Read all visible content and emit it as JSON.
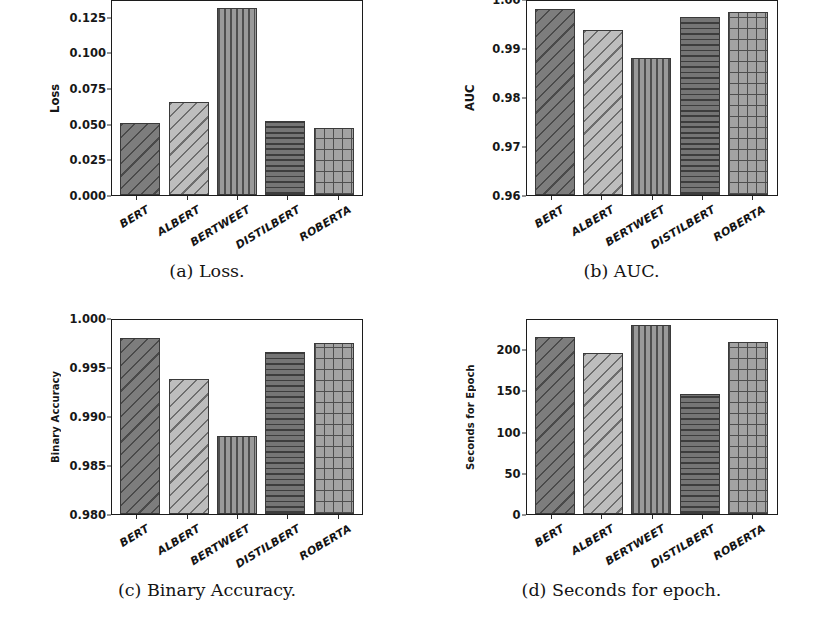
{
  "figure": {
    "models": [
      "BERT",
      "ALBERT",
      "BERTWEET",
      "DISTILBERT",
      "ROBERTA"
    ],
    "hatch_styles": [
      "hatch-diag-dark",
      "hatch-diag-light",
      "hatch-vert",
      "hatch-horiz",
      "hatch-grid"
    ],
    "subfigures": [
      {
        "caption": "(a) Loss."
      },
      {
        "caption": "(b) AUC."
      },
      {
        "caption": "(c) Binary Accuracy."
      },
      {
        "caption": "(d) Seconds for epoch."
      }
    ]
  },
  "chart_data": [
    {
      "type": "bar",
      "id": "loss",
      "title": "(a) Loss.",
      "xlabel": "",
      "ylabel": "Loss",
      "categories": [
        "BERT",
        "ALBERT",
        "BERTWEET",
        "DISTILBERT",
        "ROBERTA"
      ],
      "values": [
        0.0505,
        0.0655,
        0.1315,
        0.052,
        0.0468
      ],
      "ylim": [
        0.0,
        0.1375
      ],
      "yticks": [
        0.0,
        0.025,
        0.05,
        0.075,
        0.1,
        0.125
      ],
      "ytick_labels": [
        "0.000",
        "0.025",
        "0.050",
        "0.075",
        "0.100",
        "0.125"
      ],
      "grid": false,
      "legend": "none"
    },
    {
      "type": "bar",
      "id": "auc",
      "title": "(b) AUC.",
      "xlabel": "",
      "ylabel": "AUC",
      "categories": [
        "BERT",
        "ALBERT",
        "BERTWEET",
        "DISTILBERT",
        "ROBERTA"
      ],
      "values": [
        0.998,
        0.9937,
        0.988,
        0.9963,
        0.9973
      ],
      "ylim": [
        0.96,
        1.0
      ],
      "yticks": [
        0.96,
        0.97,
        0.98,
        0.99,
        1.0
      ],
      "ytick_labels": [
        "0.96",
        "0.97",
        "0.98",
        "0.99",
        "1.00"
      ],
      "grid": false,
      "legend": "none"
    },
    {
      "type": "bar",
      "id": "binary-accuracy",
      "title": "(c) Binary Accuracy.",
      "xlabel": "",
      "ylabel": "Binary Accuracy",
      "categories": [
        "BERT",
        "ALBERT",
        "BERTWEET",
        "DISTILBERT",
        "ROBERTA"
      ],
      "values": [
        0.998,
        0.9938,
        0.988,
        0.9965,
        0.9974
      ],
      "ylim": [
        0.98,
        1.0
      ],
      "yticks": [
        0.98,
        0.985,
        0.99,
        0.995,
        1.0
      ],
      "ytick_labels": [
        "0.980",
        "0.985",
        "0.990",
        "0.995",
        "1.000"
      ],
      "grid": false,
      "legend": "none"
    },
    {
      "type": "bar",
      "id": "seconds-for-epoch",
      "title": "(d) Seconds for epoch.",
      "xlabel": "",
      "ylabel": "Seconds for Epoch",
      "categories": [
        "BERT",
        "ALBERT",
        "BERTWEET",
        "DISTILBERT",
        "ROBERTA"
      ],
      "values": [
        215,
        195,
        229,
        146,
        209
      ],
      "ylim": [
        0,
        238
      ],
      "yticks": [
        0,
        50,
        100,
        150,
        200
      ],
      "ytick_labels": [
        "0",
        "50",
        "100",
        "150",
        "200"
      ],
      "grid": false,
      "legend": "none"
    }
  ]
}
